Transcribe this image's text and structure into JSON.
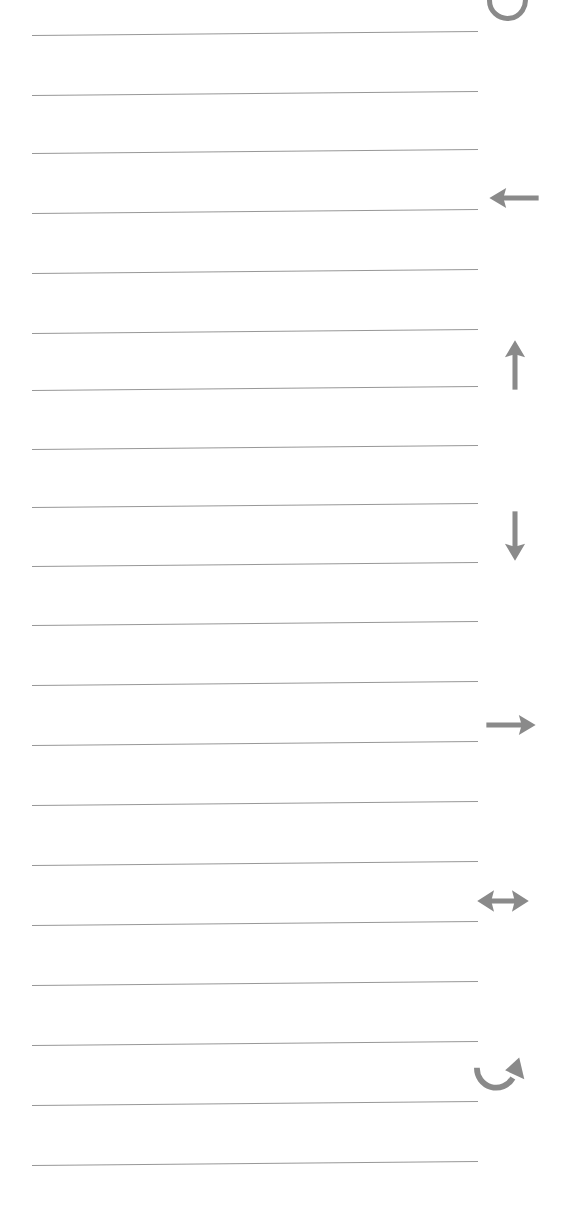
{
  "page": {
    "kind": "ruled-notebook-page",
    "width": 574,
    "height": 1218,
    "background_color": "#ffffff",
    "rule_color": "#8e8e8e",
    "icon_color": "#8a8a8a"
  },
  "ruled_lines": {
    "count": 20,
    "left_x": 32,
    "right_x": 478,
    "thickness": 1.3,
    "tilt_degrees": -0.52,
    "y_positions": [
      35,
      95,
      153,
      213,
      273,
      333,
      390,
      449,
      507,
      566,
      625,
      685,
      745,
      805,
      865,
      925,
      985,
      1045,
      1105,
      1165
    ]
  },
  "margin_icons": [
    {
      "name": "rotate-counterclockwise-icon",
      "label": "Rotate",
      "glyph": "circular-arrow",
      "x": 482,
      "y": -26,
      "size": 56,
      "clipped_top": true
    },
    {
      "name": "arrow-left-icon",
      "label": "Left",
      "glyph": "arrow-left",
      "x": 486,
      "y": 170,
      "size": 56,
      "clipped_top": false
    },
    {
      "name": "arrow-up-icon",
      "label": "Up",
      "glyph": "arrow-up",
      "x": 487,
      "y": 337,
      "size": 56,
      "clipped_top": false
    },
    {
      "name": "arrow-down-icon",
      "label": "Down",
      "glyph": "arrow-down",
      "x": 487,
      "y": 508,
      "size": 56,
      "clipped_top": false
    },
    {
      "name": "arrow-right-icon",
      "label": "Right",
      "glyph": "arrow-right",
      "x": 483,
      "y": 697,
      "size": 56,
      "clipped_top": false
    },
    {
      "name": "arrow-left-right-icon",
      "label": "Horizontal",
      "glyph": "arrow-left-right",
      "x": 475,
      "y": 873,
      "size": 56,
      "clipped_top": false
    },
    {
      "name": "rotate-clockwise-icon",
      "label": "Redo",
      "glyph": "curved-arrow",
      "x": 468,
      "y": 1046,
      "size": 64,
      "clipped_top": false
    }
  ]
}
